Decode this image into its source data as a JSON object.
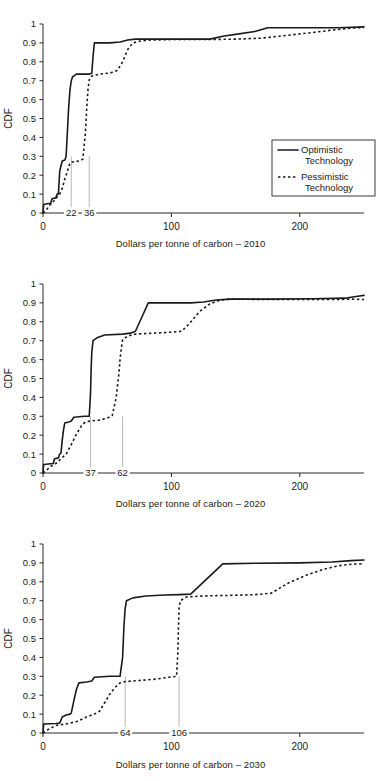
{
  "figure": {
    "panels": [
      {
        "id": "panel-2010",
        "caption": "Dollars per tonne of carbon – 2010",
        "ylabel": "CDF",
        "annotations": [
          {
            "label": "22",
            "x": 22
          },
          {
            "label": "36",
            "x": 36
          }
        ]
      },
      {
        "id": "panel-2020",
        "caption": "Dollars per tonne of carbon – 2020",
        "ylabel": "CDF",
        "annotations": [
          {
            "label": "37",
            "x": 37
          },
          {
            "label": "62",
            "x": 62
          }
        ]
      },
      {
        "id": "panel-2030",
        "caption": "Dollars per tonne of carbon – 2030",
        "ylabel": "CDF",
        "annotations": [
          {
            "label": "64",
            "x": 64
          },
          {
            "label": "106",
            "x": 106
          }
        ]
      }
    ],
    "yticks": [
      "0",
      "0.1",
      "0.2",
      "0.3",
      "0.4",
      "0.5",
      "0.6",
      "0.7",
      "0.8",
      "0.9",
      "1"
    ],
    "xticks": [
      "0",
      "100",
      "200"
    ],
    "legend": {
      "entries": [
        {
          "name": "optimistic",
          "label_line1": "Optimistic",
          "label_line2": "Technology",
          "style": "solid"
        },
        {
          "name": "pessimistic",
          "label_line1": "Pessimistic",
          "label_line2": "Technology",
          "style": "dotted"
        }
      ]
    },
    "colors": {
      "series": "#1a1a1a",
      "axis": "#2a2a2a",
      "reference_line": "#b8b8b8",
      "background": "#ffffff"
    }
  },
  "chart_data": [
    {
      "type": "line",
      "title": "",
      "subtitle": "",
      "xlabel": "Dollars per tonne of carbon – 2010",
      "ylabel": "CDF",
      "xlim": [
        0,
        250
      ],
      "ylim": [
        0,
        1
      ],
      "grid": false,
      "legend_position": "lower-right-inside",
      "annotations": [
        {
          "label": "22",
          "x": 22,
          "type": "vertical-reference"
        },
        {
          "label": "36",
          "x": 36,
          "type": "vertical-reference"
        }
      ],
      "series": [
        {
          "name": "Optimistic Technology",
          "style": "solid",
          "points": [
            [
              0,
              0.0
            ],
            [
              0.5,
              0.045
            ],
            [
              4,
              0.05
            ],
            [
              6,
              0.05
            ],
            [
              7,
              0.075
            ],
            [
              10,
              0.08
            ],
            [
              11,
              0.1
            ],
            [
              12,
              0.1
            ],
            [
              13,
              0.22
            ],
            [
              14,
              0.25
            ],
            [
              15,
              0.275
            ],
            [
              17,
              0.28
            ],
            [
              18,
              0.3
            ],
            [
              19,
              0.43
            ],
            [
              20,
              0.56
            ],
            [
              21,
              0.65
            ],
            [
              22,
              0.7
            ],
            [
              23,
              0.72
            ],
            [
              26,
              0.735
            ],
            [
              36,
              0.735
            ],
            [
              38,
              0.74
            ],
            [
              39,
              0.83
            ],
            [
              40,
              0.9
            ],
            [
              52,
              0.9
            ],
            [
              60,
              0.905
            ],
            [
              66,
              0.915
            ],
            [
              72,
              0.92
            ],
            [
              82,
              0.92
            ],
            [
              130,
              0.92
            ],
            [
              140,
              0.935
            ],
            [
              150,
              0.945
            ],
            [
              165,
              0.96
            ],
            [
              175,
              0.98
            ],
            [
              200,
              0.98
            ],
            [
              230,
              0.98
            ],
            [
              250,
              0.985
            ]
          ]
        },
        {
          "name": "Pessimistic Technology",
          "style": "dotted",
          "points": [
            [
              0,
              0.0
            ],
            [
              2,
              0.01
            ],
            [
              5,
              0.04
            ],
            [
              8,
              0.06
            ],
            [
              11,
              0.085
            ],
            [
              13,
              0.1
            ],
            [
              15,
              0.13
            ],
            [
              17,
              0.18
            ],
            [
              19,
              0.22
            ],
            [
              21,
              0.265
            ],
            [
              23,
              0.27
            ],
            [
              28,
              0.275
            ],
            [
              31,
              0.285
            ],
            [
              33,
              0.42
            ],
            [
              34,
              0.55
            ],
            [
              35,
              0.65
            ],
            [
              36,
              0.705
            ],
            [
              38,
              0.725
            ],
            [
              44,
              0.735
            ],
            [
              52,
              0.74
            ],
            [
              58,
              0.755
            ],
            [
              62,
              0.8
            ],
            [
              66,
              0.865
            ],
            [
              70,
              0.9
            ],
            [
              76,
              0.91
            ],
            [
              84,
              0.915
            ],
            [
              100,
              0.918
            ],
            [
              130,
              0.918
            ],
            [
              150,
              0.92
            ],
            [
              170,
              0.925
            ],
            [
              190,
              0.94
            ],
            [
              210,
              0.955
            ],
            [
              228,
              0.97
            ],
            [
              240,
              0.978
            ],
            [
              250,
              0.982
            ]
          ]
        }
      ]
    },
    {
      "type": "line",
      "title": "",
      "subtitle": "",
      "xlabel": "Dollars per tonne of carbon – 2020",
      "ylabel": "CDF",
      "xlim": [
        0,
        250
      ],
      "ylim": [
        0,
        1
      ],
      "grid": false,
      "legend_position": "none",
      "annotations": [
        {
          "label": "37",
          "x": 37,
          "type": "vertical-reference"
        },
        {
          "label": "62",
          "x": 62,
          "type": "vertical-reference"
        }
      ],
      "series": [
        {
          "name": "Optimistic Technology",
          "style": "solid",
          "points": [
            [
              0,
              0.0
            ],
            [
              0.5,
              0.045
            ],
            [
              8,
              0.05
            ],
            [
              9,
              0.075
            ],
            [
              12,
              0.08
            ],
            [
              13,
              0.1
            ],
            [
              14,
              0.105
            ],
            [
              15,
              0.175
            ],
            [
              16,
              0.23
            ],
            [
              17,
              0.265
            ],
            [
              20,
              0.27
            ],
            [
              22,
              0.275
            ],
            [
              24,
              0.295
            ],
            [
              32,
              0.3
            ],
            [
              36,
              0.3
            ],
            [
              37,
              0.42
            ],
            [
              37.5,
              0.55
            ],
            [
              38,
              0.64
            ],
            [
              39,
              0.7
            ],
            [
              42,
              0.715
            ],
            [
              48,
              0.73
            ],
            [
              62,
              0.735
            ],
            [
              68,
              0.74
            ],
            [
              72,
              0.75
            ],
            [
              78,
              0.84
            ],
            [
              82,
              0.9
            ],
            [
              100,
              0.9
            ],
            [
              115,
              0.9
            ],
            [
              125,
              0.905
            ],
            [
              135,
              0.915
            ],
            [
              145,
              0.92
            ],
            [
              175,
              0.92
            ],
            [
              210,
              0.922
            ],
            [
              235,
              0.925
            ],
            [
              245,
              0.935
            ],
            [
              250,
              0.94
            ]
          ]
        },
        {
          "name": "Pessimistic Technology",
          "style": "dotted",
          "points": [
            [
              0,
              0.0
            ],
            [
              2,
              0.01
            ],
            [
              6,
              0.035
            ],
            [
              10,
              0.05
            ],
            [
              14,
              0.075
            ],
            [
              18,
              0.1
            ],
            [
              22,
              0.15
            ],
            [
              26,
              0.205
            ],
            [
              30,
              0.25
            ],
            [
              33,
              0.27
            ],
            [
              37,
              0.275
            ],
            [
              44,
              0.28
            ],
            [
              50,
              0.29
            ],
            [
              54,
              0.305
            ],
            [
              57,
              0.4
            ],
            [
              59,
              0.52
            ],
            [
              60,
              0.6
            ],
            [
              61,
              0.66
            ],
            [
              62,
              0.705
            ],
            [
              66,
              0.725
            ],
            [
              72,
              0.735
            ],
            [
              86,
              0.74
            ],
            [
              100,
              0.745
            ],
            [
              108,
              0.75
            ],
            [
              114,
              0.79
            ],
            [
              122,
              0.855
            ],
            [
              130,
              0.895
            ],
            [
              138,
              0.915
            ],
            [
              148,
              0.92
            ],
            [
              175,
              0.918
            ],
            [
              205,
              0.918
            ],
            [
              228,
              0.918
            ],
            [
              240,
              0.92
            ],
            [
              250,
              0.918
            ]
          ]
        }
      ]
    },
    {
      "type": "line",
      "title": "",
      "subtitle": "",
      "xlabel": "Dollars per tonne of carbon – 2030",
      "ylabel": "CDF",
      "xlim": [
        0,
        250
      ],
      "ylim": [
        0,
        1
      ],
      "grid": false,
      "legend_position": "none",
      "annotations": [
        {
          "label": "64",
          "x": 64,
          "type": "vertical-reference"
        },
        {
          "label": "106",
          "x": 106,
          "type": "vertical-reference"
        }
      ],
      "series": [
        {
          "name": "Optimistic Technology",
          "style": "solid",
          "points": [
            [
              0,
              0.0
            ],
            [
              0.5,
              0.048
            ],
            [
              10,
              0.05
            ],
            [
              13,
              0.052
            ],
            [
              15,
              0.085
            ],
            [
              18,
              0.095
            ],
            [
              21,
              0.1
            ],
            [
              22,
              0.105
            ],
            [
              24,
              0.17
            ],
            [
              26,
              0.23
            ],
            [
              28,
              0.265
            ],
            [
              34,
              0.27
            ],
            [
              38,
              0.275
            ],
            [
              40,
              0.295
            ],
            [
              52,
              0.3
            ],
            [
              60,
              0.3
            ],
            [
              62,
              0.4
            ],
            [
              63,
              0.56
            ],
            [
              64,
              0.66
            ],
            [
              65,
              0.7
            ],
            [
              70,
              0.715
            ],
            [
              80,
              0.725
            ],
            [
              95,
              0.73
            ],
            [
              106,
              0.732
            ],
            [
              115,
              0.735
            ],
            [
              140,
              0.895
            ],
            [
              165,
              0.898
            ],
            [
              200,
              0.9
            ],
            [
              225,
              0.905
            ],
            [
              240,
              0.912
            ],
            [
              250,
              0.915
            ]
          ]
        },
        {
          "name": "Pessimistic Technology",
          "style": "dotted",
          "points": [
            [
              0,
              0.0
            ],
            [
              3,
              0.015
            ],
            [
              10,
              0.04
            ],
            [
              18,
              0.048
            ],
            [
              26,
              0.06
            ],
            [
              34,
              0.085
            ],
            [
              40,
              0.1
            ],
            [
              44,
              0.115
            ],
            [
              48,
              0.16
            ],
            [
              52,
              0.205
            ],
            [
              56,
              0.24
            ],
            [
              60,
              0.265
            ],
            [
              64,
              0.272
            ],
            [
              75,
              0.278
            ],
            [
              88,
              0.285
            ],
            [
              98,
              0.295
            ],
            [
              104,
              0.3
            ],
            [
              105,
              0.42
            ],
            [
              105.5,
              0.55
            ],
            [
              106,
              0.66
            ],
            [
              107,
              0.7
            ],
            [
              112,
              0.72
            ],
            [
              125,
              0.725
            ],
            [
              145,
              0.728
            ],
            [
              165,
              0.732
            ],
            [
              178,
              0.74
            ],
            [
              190,
              0.79
            ],
            [
              205,
              0.835
            ],
            [
              218,
              0.865
            ],
            [
              230,
              0.885
            ],
            [
              240,
              0.893
            ],
            [
              250,
              0.895
            ]
          ]
        }
      ]
    }
  ]
}
